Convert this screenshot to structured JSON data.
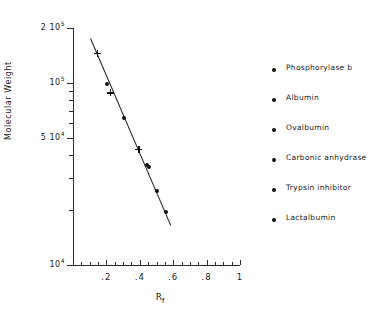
{
  "chart_data": {
    "type": "scatter",
    "title": "",
    "xlabel": "Rf",
    "ylabel": "Molecular Weight",
    "xlim": [
      0,
      1
    ],
    "ylim": [
      10000,
      200000
    ],
    "yscale": "log",
    "xscale": "linear",
    "grid": false,
    "legend_position": "right",
    "x_tick_labels": [
      ".2",
      ".4",
      ".6",
      ".8",
      "1"
    ],
    "x_tick_values": [
      0.2,
      0.4,
      0.6,
      0.8,
      1.0
    ],
    "x_minor_tick_step": 0.05,
    "y_tick_labels": [
      "2 10^5",
      "10^5",
      "5 10^4",
      "10^4"
    ],
    "y_tick_values": [
      200000,
      100000,
      50000,
      10000
    ],
    "y_tick_label_parts": [
      {
        "mantissa": "2 10",
        "exponent": "5"
      },
      {
        "mantissa": "10",
        "exponent": "5"
      },
      {
        "mantissa": "5 10",
        "exponent": "4"
      },
      {
        "mantissa": "10",
        "exponent": "4"
      }
    ],
    "axis_title_x_base": "R",
    "axis_title_x_sub": "f",
    "series": [
      {
        "name": "standards",
        "marker": "plus",
        "points": [
          {
            "x": 0.145,
            "y": 145000
          },
          {
            "x": 0.225,
            "y": 88000
          },
          {
            "x": 0.395,
            "y": 43000
          }
        ]
      },
      {
        "name": "samples",
        "marker": "dot",
        "points": [
          {
            "x": 0.205,
            "y": 99000
          },
          {
            "x": 0.305,
            "y": 64000
          },
          {
            "x": 0.445,
            "y": 35500
          },
          {
            "x": 0.455,
            "y": 34500
          },
          {
            "x": 0.505,
            "y": 25500
          },
          {
            "x": 0.555,
            "y": 19500
          }
        ]
      }
    ],
    "fit_line": {
      "name": "standard-curve",
      "x_start": 0.105,
      "y_start": 175000,
      "x_end": 0.585,
      "y_end": 16500
    },
    "legend_entries": [
      "Phosphorylase b",
      "Albumin",
      "Ovalbumin",
      "Carbonic anhydrase",
      "Trypsin inhibitor",
      "Lactalbumin"
    ],
    "colors": {
      "marker": "#111111",
      "line": "#2b2b2b",
      "axis": "#2b2b2b",
      "text": "#1a1a1a",
      "background": "#ffffff"
    }
  }
}
